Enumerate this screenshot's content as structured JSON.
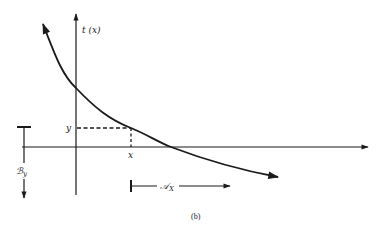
{
  "figure": {
    "caption": "(b)",
    "colors": {
      "ink": "#1a1a1a",
      "background": "#ffffff"
    },
    "labels": {
      "y_axis": "t (x)",
      "point_y": "y",
      "point_x": "x",
      "range_label_main": "ℬ",
      "range_label_sub": "y",
      "domain_label_main": "𝒜",
      "domain_label_sub": "X"
    },
    "elements": {
      "horizontal_axis": "x-axis with arrow to the right",
      "vertical_axis": "t-axis with arrow upward",
      "curve": "decreasing curve t(x) with arrows at both ends",
      "dashed_guides": "dashed lines from point (x, y) to both axes",
      "range_arrow": "downward arrow starting at bar at height y (set B_y)",
      "domain_arrow": "rightward arrow starting at bar at x (set A_X)"
    }
  }
}
